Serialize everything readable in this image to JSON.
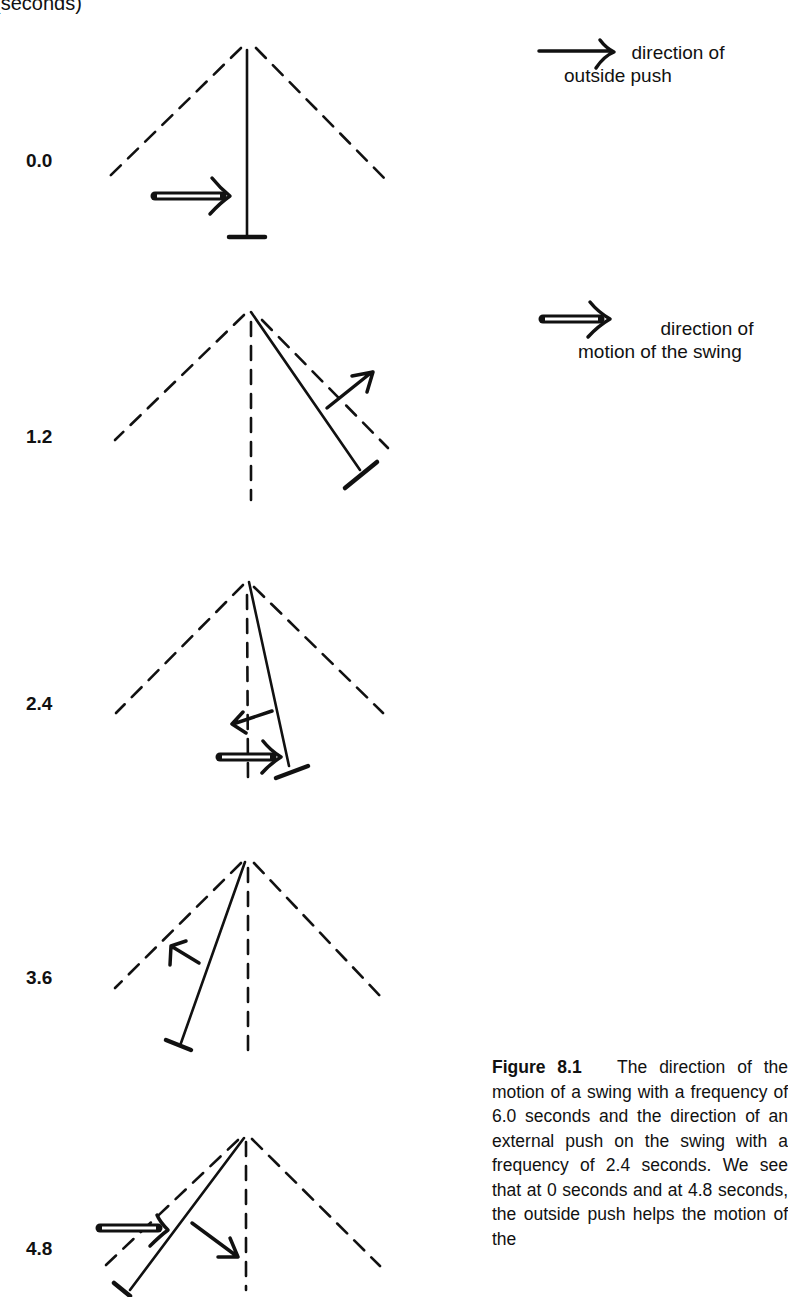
{
  "header": {
    "axis_label": "(seconds)"
  },
  "legend": {
    "outside_push": {
      "icon": "single-arrow-icon",
      "label_line1": "direction of",
      "label_line2": "outside push"
    },
    "swing_motion": {
      "icon": "double-arrow-icon",
      "label_line1": "direction of",
      "label_line2": "motion of the swing"
    }
  },
  "frames": [
    {
      "time": "0.0",
      "swing_position": "vertical (rest)",
      "swing_motion": "right",
      "outside_push": "none"
    },
    {
      "time": "1.2",
      "swing_position": "right near max",
      "swing_motion": "none",
      "outside_push": "up-right"
    },
    {
      "time": "2.4",
      "swing_position": "slightly right",
      "swing_motion": "right",
      "outside_push": "left"
    },
    {
      "time": "3.6",
      "swing_position": "left",
      "swing_motion": "none",
      "outside_push": "up-left"
    },
    {
      "time": "4.8",
      "swing_position": "left near max",
      "swing_motion": "right",
      "outside_push": "down-right"
    }
  ],
  "caption": {
    "figure_label": "Figure 8.1",
    "text": "The direction of the motion of a swing with a frequency of 6.0 seconds and the direction of an external push on the swing with a frequency of 2.4 seconds. We see that at 0 seconds and at 4.8 seconds, the outside push helps the motion of the"
  }
}
